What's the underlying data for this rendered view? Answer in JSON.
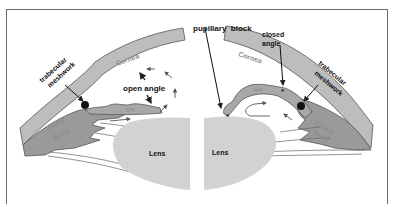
{
  "diagram": {
    "left_panel": {
      "title": "open angle",
      "labels": {
        "trabecular": "trabecular",
        "meshwork": "meshwork",
        "cornea": "Cornea",
        "iris": "Iris",
        "ciliary": "Ciliary",
        "body": "Body",
        "lens": "Lens",
        "angle": "open angle"
      }
    },
    "right_panel": {
      "labels": {
        "pupillary_block": "pupillary  block",
        "closed": "closed",
        "angle": "angle",
        "trabecular": "trabecular",
        "meshwork": "meshwork",
        "cornea": "Cornea",
        "iris": "Iris",
        "ciliary": "Ciliary",
        "body": "Body",
        "lens": "Lens",
        "star": "*"
      }
    },
    "colors": {
      "cornea": "#bdbdbd",
      "ciliary": "#9a9a9a",
      "lens": "#d2d2d2",
      "stroke": "#555555",
      "text": "#111111"
    }
  }
}
